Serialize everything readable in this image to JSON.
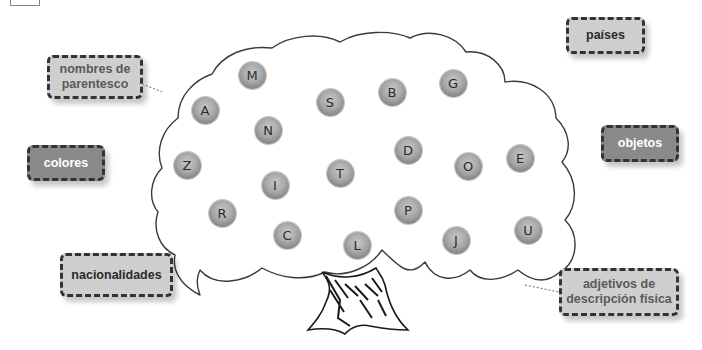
{
  "labels": {
    "parentesco": "nombres de parentesco",
    "colores": "colores",
    "nacionalidades": "nacionalidades",
    "paises": "países",
    "objetos": "objetos",
    "adjetivos": "adjetivos de descripción física"
  },
  "letters": {
    "M": "M",
    "A": "A",
    "S": "S",
    "B": "B",
    "G": "G",
    "N": "N",
    "Z": "Z",
    "D": "D",
    "T": "T",
    "O": "O",
    "E": "E",
    "I": "I",
    "R": "R",
    "P": "P",
    "C": "C",
    "L": "L",
    "J": "J",
    "U": "U"
  },
  "colors": {
    "box_light": "#cfcfcf",
    "box_dark": "#8a8a8a",
    "ball": "#a8a8a8",
    "outline": "#333333"
  }
}
